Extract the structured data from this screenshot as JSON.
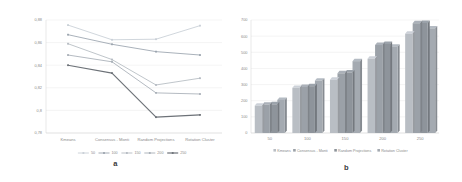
{
  "figure": {
    "panels": [
      {
        "caption": "a"
      },
      {
        "caption": "b"
      }
    ]
  },
  "chart_data": [
    {
      "type": "line",
      "panel_label": "a",
      "title": "",
      "xlabel": "",
      "ylabel": "",
      "categories": [
        "Kmeans",
        "Consensus - Monti",
        "Random Projections",
        "Rotation Cluster"
      ],
      "ylim": [
        0.78,
        0.88
      ],
      "yticks": [
        0.78,
        0.8,
        0.82,
        0.84,
        0.86,
        0.88
      ],
      "ytick_labels": [
        "0,78",
        "0,8",
        "0,82",
        "0,84",
        "0,86",
        "0,88"
      ],
      "grid": true,
      "legend_position": "bottom",
      "markers": true,
      "series": [
        {
          "name": "50",
          "color": "#c8cfd6",
          "values": [
            0.8755,
            0.8625,
            0.863,
            0.875
          ]
        },
        {
          "name": "100",
          "color": "#9aa3ad",
          "values": [
            0.867,
            0.8585,
            0.852,
            0.849
          ]
        },
        {
          "name": "150",
          "color": "#b4bac1",
          "values": [
            0.859,
            0.845,
            0.8225,
            0.8285
          ]
        },
        {
          "name": "200",
          "color": "#a7aeb6",
          "values": [
            0.849,
            0.843,
            0.8155,
            0.8145
          ]
        },
        {
          "name": "250",
          "color": "#6d7278",
          "values": [
            0.84,
            0.833,
            0.794,
            0.796
          ]
        }
      ]
    },
    {
      "type": "bar",
      "panel_label": "b",
      "title": "",
      "xlabel": "",
      "ylabel": "",
      "categories": [
        "50",
        "100",
        "150",
        "200",
        "250"
      ],
      "ylim": [
        0,
        700
      ],
      "yticks": [
        0,
        100,
        200,
        300,
        400,
        500,
        600,
        700
      ],
      "ytick_labels": [
        "0",
        "100",
        "200",
        "300",
        "400",
        "500",
        "600",
        "700"
      ],
      "grid": true,
      "legend_position": "bottom",
      "series": [
        {
          "name": "Kmeans",
          "color": "#b9bec4",
          "values": [
            170,
            280,
            330,
            460,
            615
          ]
        },
        {
          "name": "Consensus - Monti",
          "color": "#9ba1a8",
          "values": [
            175,
            285,
            370,
            545,
            680
          ]
        },
        {
          "name": "Random Projections",
          "color": "#8e949b",
          "values": [
            178,
            290,
            375,
            552,
            682
          ]
        },
        {
          "name": "Rotation Cluster",
          "color": "#a4aab1",
          "values": [
            205,
            325,
            445,
            535,
            648
          ]
        }
      ]
    }
  ]
}
